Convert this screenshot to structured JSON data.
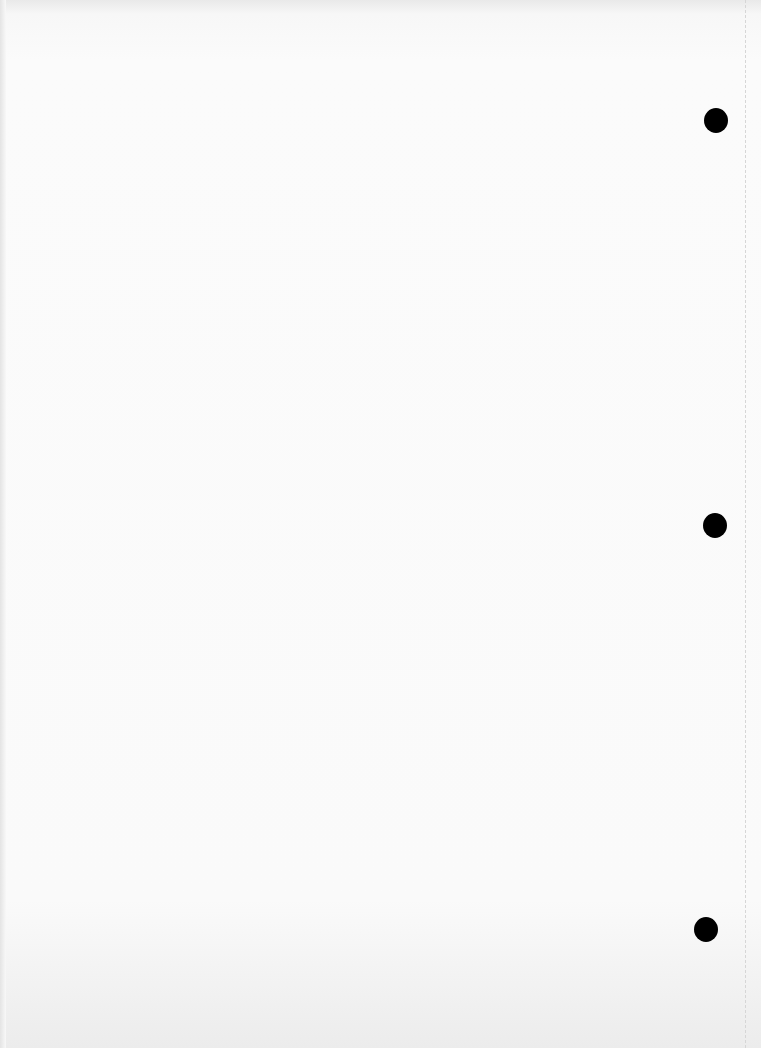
{
  "page": {
    "type": "blank scanned sheet",
    "background_color": "#fafafa",
    "punch_holes": [
      {
        "x": 704,
        "y": 108,
        "w": 24,
        "h": 25
      },
      {
        "x": 703,
        "y": 513,
        "w": 24,
        "h": 25
      },
      {
        "x": 694,
        "y": 917,
        "w": 24,
        "h": 25
      }
    ],
    "hole_color": "#000000"
  }
}
